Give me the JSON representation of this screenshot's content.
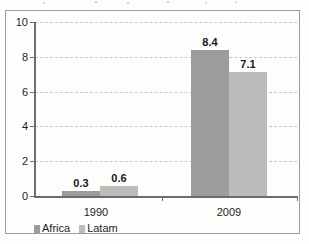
{
  "chart_data": {
    "type": "bar",
    "title": "",
    "subtitle": "",
    "xlabel": "",
    "ylabel": "",
    "categories": [
      "1990",
      "2009"
    ],
    "series": [
      {
        "name": "Africa",
        "color": "#9c9c9c",
        "values": [
          0.3,
          8.4
        ]
      },
      {
        "name": "Latam",
        "color": "#bcbcbc",
        "values": [
          0.6,
          7.1
        ]
      }
    ],
    "ylim": [
      0,
      10
    ],
    "yticks": [
      "0",
      "2",
      "4",
      "6",
      "8",
      "10"
    ],
    "ytick_values": [
      0,
      2,
      4,
      6,
      8,
      10
    ],
    "grid": true,
    "grid_axis": "y",
    "grid_style": "dashed",
    "legend_position": "bottom-left",
    "data_labels": [
      {
        "series": "Africa",
        "category": "1990",
        "text": "0.3"
      },
      {
        "series": "Latam",
        "category": "1990",
        "text": "0.6"
      },
      {
        "series": "Africa",
        "category": "2009",
        "text": "8.4"
      },
      {
        "series": "Latam",
        "category": "2009",
        "text": "7.1"
      }
    ]
  },
  "axis": {
    "y_labels": [
      "10",
      "8",
      "6",
      "4",
      "2",
      "0"
    ]
  },
  "categories": {
    "first": "1990",
    "second": "2009"
  },
  "labels": {
    "africa_1990": "0.3",
    "latam_1990": "0.6",
    "africa_2009": "8.4",
    "latam_2009": "7.1"
  },
  "legend": {
    "africa": "Africa",
    "latam": "Latam"
  },
  "colors": {
    "africa": "#9c9c9c",
    "latam": "#bcbcbc",
    "axis": "#6d6d6d",
    "grid": "#c9c9c9",
    "frame": "#9b9b9b"
  }
}
